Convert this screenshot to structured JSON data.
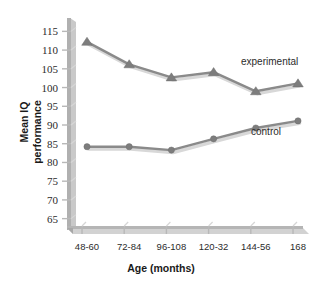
{
  "chart_data": {
    "type": "line",
    "title": "",
    "xlabel": "Age (months)",
    "ylabel": "Mean IQ performance",
    "ylabel_line1": "Mean IQ",
    "ylabel_line2": "performance",
    "categories": [
      "48-60",
      "72-84",
      "96-108",
      "120-32",
      "144-56",
      "168"
    ],
    "yticks": [
      115,
      110,
      105,
      100,
      95,
      90,
      85,
      80,
      75,
      70,
      65
    ],
    "ylim": [
      62.5,
      117.5
    ],
    "grid": false,
    "legend": "inline-annotations",
    "series": [
      {
        "name": "experimental",
        "marker": "triangle",
        "color": "#8a8a8a",
        "values": [
          112.2,
          106.2,
          102.7,
          104.1,
          99.0,
          101.1
        ]
      },
      {
        "name": "control",
        "marker": "circle",
        "color": "#8a8a8a",
        "values": [
          84.2,
          84.2,
          83.3,
          86.3,
          89.2,
          91.1
        ]
      }
    ],
    "annotations": [
      {
        "text": "experimental",
        "series": "experimental"
      },
      {
        "text": "control",
        "series": "control"
      }
    ]
  },
  "colors": {
    "line": "#8a8a8a",
    "marker": "#7d7d7d",
    "axis": "#b8b8b8",
    "axis_shadow": "#d6d6d6",
    "text": "#2b2b2b",
    "background": "#ffffff"
  }
}
